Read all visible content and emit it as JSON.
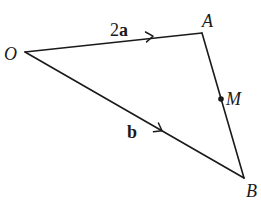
{
  "diagram": {
    "type": "vector-triangle",
    "points": {
      "O": {
        "label": "O",
        "x": 25,
        "y": 52
      },
      "A": {
        "label": "A",
        "x": 202,
        "y": 33
      },
      "B": {
        "label": "B",
        "x": 244,
        "y": 178
      },
      "M": {
        "label": "M",
        "x": 221,
        "y": 99
      }
    },
    "edges": [
      {
        "from": "O",
        "to": "A",
        "vector_label": "2a",
        "vector_label_number": "2",
        "vector_label_symbol": "a"
      },
      {
        "from": "O",
        "to": "B",
        "vector_label": "b"
      },
      {
        "from": "A",
        "to": "B"
      }
    ],
    "labels": {
      "O": "O",
      "A": "A",
      "B": "B",
      "M": "M",
      "oa_vector_number": "2",
      "oa_vector_symbol": "a",
      "ob_vector": "b"
    },
    "colors": {
      "line": "#1a1a1a",
      "background": "#ffffff"
    }
  }
}
